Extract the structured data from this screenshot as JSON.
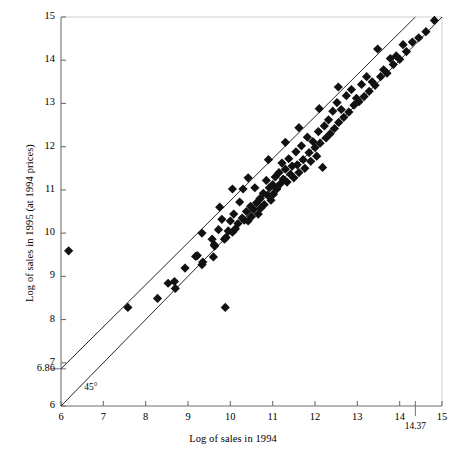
{
  "chart_data": {
    "type": "scatter",
    "title": "",
    "xlabel": "Log of sales in 1994",
    "ylabel": "Log of sales in 1995 (at 1994 prices)",
    "xlim": [
      6,
      15
    ],
    "ylim": [
      6,
      15
    ],
    "grid": false,
    "legend": null,
    "xticks": [
      6,
      7,
      8,
      9,
      10,
      11,
      12,
      13,
      14,
      15
    ],
    "xtick_labels": [
      "6",
      "7",
      "8",
      "9",
      "10",
      "11",
      "12",
      "13",
      "14",
      "15"
    ],
    "yticks": [
      6,
      7,
      8,
      9,
      10,
      11,
      12,
      13,
      14,
      15
    ],
    "ytick_labels": [
      "6",
      "7",
      "8",
      "9",
      "10",
      "11",
      "12",
      "13",
      "14",
      "15"
    ],
    "special_xticks": [
      {
        "value": 14.37,
        "label": "14.37"
      }
    ],
    "special_yticks": [
      {
        "value": 6.86,
        "label": "6.86"
      }
    ],
    "annotations": [
      {
        "text": "45°",
        "x": 6.55,
        "y": 6.28
      }
    ],
    "reference_lines": [
      {
        "name": "45-degree-line",
        "label": "45°",
        "from": [
          6,
          6
        ],
        "to": [
          15,
          15
        ],
        "color": "#000000"
      },
      {
        "name": "fitted-line",
        "label": "",
        "from": [
          6,
          6.86
        ],
        "to": [
          14.37,
          15
        ],
        "color": "#000000"
      }
    ],
    "marker": {
      "shape": "diamond",
      "color": "#111111",
      "size": 4.6
    },
    "points": [
      [
        6.18,
        9.59
      ],
      [
        7.58,
        8.28
      ],
      [
        8.28,
        8.49
      ],
      [
        8.53,
        8.84
      ],
      [
        8.68,
        8.88
      ],
      [
        8.7,
        8.72
      ],
      [
        8.93,
        9.19
      ],
      [
        9.22,
        9.48
      ],
      [
        9.18,
        9.46
      ],
      [
        9.33,
        9.27
      ],
      [
        9.35,
        9.33
      ],
      [
        9.33,
        10.0
      ],
      [
        9.57,
        9.86
      ],
      [
        9.63,
        9.7
      ],
      [
        9.6,
        9.45
      ],
      [
        9.62,
        9.73
      ],
      [
        9.88,
        8.28
      ],
      [
        9.75,
        10.6
      ],
      [
        9.8,
        10.32
      ],
      [
        9.86,
        9.86
      ],
      [
        9.9,
        9.9
      ],
      [
        9.95,
        10.05
      ],
      [
        10.0,
        10.28
      ],
      [
        10.05,
        10.02
      ],
      [
        10.08,
        10.44
      ],
      [
        10.12,
        10.1
      ],
      [
        10.18,
        10.22
      ],
      [
        10.22,
        10.72
      ],
      [
        10.28,
        10.35
      ],
      [
        10.3,
        11.02
      ],
      [
        10.33,
        10.3
      ],
      [
        10.38,
        10.5
      ],
      [
        10.42,
        10.28
      ],
      [
        10.48,
        10.62
      ],
      [
        10.5,
        10.38
      ],
      [
        10.55,
        10.55
      ],
      [
        10.58,
        11.05
      ],
      [
        10.62,
        10.7
      ],
      [
        10.66,
        10.44
      ],
      [
        10.7,
        10.8
      ],
      [
        10.72,
        10.58
      ],
      [
        10.78,
        10.92
      ],
      [
        10.8,
        10.66
      ],
      [
        10.85,
        11.22
      ],
      [
        10.88,
        10.88
      ],
      [
        10.92,
        11.05
      ],
      [
        10.96,
        10.76
      ],
      [
        11.0,
        11.12
      ],
      [
        11.02,
        10.9
      ],
      [
        11.06,
        11.3
      ],
      [
        11.1,
        11.02
      ],
      [
        11.15,
        11.4
      ],
      [
        11.18,
        11.14
      ],
      [
        11.22,
        11.62
      ],
      [
        11.25,
        11.25
      ],
      [
        11.3,
        11.48
      ],
      [
        11.34,
        11.18
      ],
      [
        11.38,
        11.72
      ],
      [
        11.42,
        11.36
      ],
      [
        11.46,
        11.55
      ],
      [
        11.5,
        11.28
      ],
      [
        11.55,
        11.88
      ],
      [
        11.58,
        11.58
      ],
      [
        11.62,
        11.4
      ],
      [
        11.68,
        12.02
      ],
      [
        11.72,
        11.7
      ],
      [
        11.76,
        11.5
      ],
      [
        11.82,
        12.22
      ],
      [
        11.86,
        11.86
      ],
      [
        11.9,
        11.66
      ],
      [
        11.95,
        12.12
      ],
      [
        12.0,
        11.98
      ],
      [
        12.04,
        11.78
      ],
      [
        12.08,
        12.35
      ],
      [
        12.12,
        12.08
      ],
      [
        12.18,
        11.52
      ],
      [
        12.22,
        12.48
      ],
      [
        12.26,
        12.2
      ],
      [
        12.32,
        12.62
      ],
      [
        12.36,
        12.3
      ],
      [
        12.42,
        12.82
      ],
      [
        12.46,
        12.42
      ],
      [
        12.52,
        13.02
      ],
      [
        12.56,
        12.56
      ],
      [
        12.62,
        12.86
      ],
      [
        12.68,
        12.68
      ],
      [
        12.74,
        13.18
      ],
      [
        12.8,
        12.8
      ],
      [
        12.86,
        13.32
      ],
      [
        12.92,
        12.96
      ],
      [
        12.98,
        13.12
      ],
      [
        13.04,
        13.04
      ],
      [
        13.1,
        13.44
      ],
      [
        13.16,
        13.16
      ],
      [
        13.22,
        13.62
      ],
      [
        13.28,
        13.28
      ],
      [
        13.35,
        13.5
      ],
      [
        13.42,
        13.42
      ],
      [
        13.48,
        14.26
      ],
      [
        13.55,
        13.62
      ],
      [
        13.62,
        13.78
      ],
      [
        13.7,
        13.7
      ],
      [
        13.78,
        14.04
      ],
      [
        13.85,
        13.9
      ],
      [
        13.92,
        14.1
      ],
      [
        14.0,
        14.02
      ],
      [
        14.08,
        14.36
      ],
      [
        14.16,
        14.2
      ],
      [
        14.3,
        14.42
      ],
      [
        14.45,
        14.52
      ],
      [
        14.62,
        14.66
      ],
      [
        14.82,
        14.92
      ],
      [
        10.42,
        11.28
      ],
      [
        10.9,
        11.7
      ],
      [
        11.3,
        12.1
      ],
      [
        11.62,
        12.44
      ],
      [
        12.1,
        12.88
      ],
      [
        12.55,
        13.38
      ],
      [
        10.05,
        11.02
      ],
      [
        9.72,
        10.08
      ]
    ]
  },
  "plot_geometry": {
    "left_px": 61,
    "right_px": 442,
    "top_px": 17,
    "bottom_px": 406
  }
}
